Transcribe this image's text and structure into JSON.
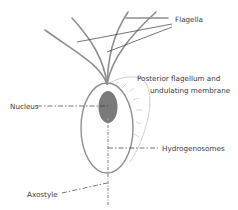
{
  "labels": {
    "flagella": "Flagella",
    "posterior_line1": "Posterior flagellum and",
    "posterior_line2": "undulating membrane",
    "nucleus": "Nucleus",
    "hydrogenosomes": "Hydrogenosomes",
    "axostyle": "Axostyle"
  },
  "colors": {
    "cell_outline": "#8f8f8f",
    "flagella": "#8f8f8f",
    "nucleus_fill": "#7a7a7a",
    "membrane_outline": "#bdbdbd",
    "leader_lines": "#3a3a3a",
    "text": "#3a3a3a"
  }
}
